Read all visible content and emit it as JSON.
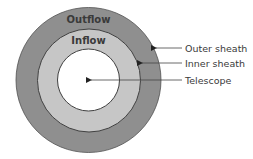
{
  "diagram": {
    "type": "concentric-circles",
    "colors": {
      "outer_fill": "#8f8f8f",
      "inner_fill": "#c6c6c6",
      "core_fill": "#ffffff",
      "stroke": "#404040",
      "text": "#3a3a3a"
    },
    "rings": [
      {
        "id": "outer",
        "region_label": "Outflow"
      },
      {
        "id": "inner",
        "region_label": "Inflow"
      },
      {
        "id": "core",
        "region_label": ""
      }
    ],
    "callouts": [
      {
        "label": "Outer sheath",
        "target": "outer"
      },
      {
        "label": "Inner sheath",
        "target": "inner"
      },
      {
        "label": "Telescope",
        "target": "core"
      }
    ]
  }
}
